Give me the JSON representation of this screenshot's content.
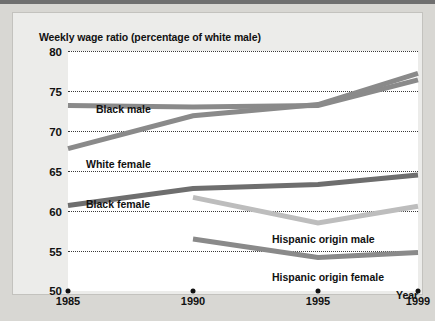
{
  "figure": {
    "title": "Weekly wage ratio (percentage of white male)",
    "year_axis_title": "Year"
  },
  "chart_data": {
    "type": "line",
    "title": "Weekly wage ratio (percentage of white male)",
    "xlabel": "Year",
    "ylabel": "Weekly wage ratio (percentage of white male)",
    "x": [
      1985,
      1990,
      1995,
      1999
    ],
    "xtick_labels": [
      "1985",
      "1990",
      "1995",
      "1999"
    ],
    "ytick_labels": [
      "80",
      "75",
      "70",
      "65",
      "60",
      "55",
      "50"
    ],
    "yticks": [
      80,
      75,
      70,
      65,
      60,
      55,
      50
    ],
    "ylim": [
      50,
      80
    ],
    "xlim": [
      1985,
      1999
    ],
    "grid": "horizontal-dotted",
    "legend": "inline-labels",
    "series": [
      {
        "name": "Black male",
        "color": "#8a8a8a",
        "x": [
          1985,
          1990,
          1995,
          1999
        ],
        "values": [
          73.2,
          73.0,
          73.2,
          76.4
        ]
      },
      {
        "name": "White female",
        "color": "#8a8a8a",
        "x": [
          1985,
          1990,
          1995,
          1999
        ],
        "values": [
          67.8,
          71.9,
          73.3,
          77.2
        ]
      },
      {
        "name": "Black female",
        "color": "#6e6e6e",
        "x": [
          1985,
          1990,
          1995,
          1999
        ],
        "values": [
          60.7,
          62.8,
          63.3,
          64.5
        ]
      },
      {
        "name": "Hispanic origin male",
        "color": "#bdbdbd",
        "x": [
          1990,
          1995,
          1999
        ],
        "values": [
          61.7,
          58.5,
          60.6
        ]
      },
      {
        "name": "Hispanic origin female",
        "color": "#8a8a8a",
        "x": [
          1990,
          1995,
          1999
        ],
        "values": [
          56.5,
          54.2,
          54.8
        ]
      }
    ],
    "series_labels": [
      {
        "text": "Black male",
        "left": 28,
        "top": 52
      },
      {
        "text": "White female",
        "left": 18,
        "top": 107
      },
      {
        "text": "Black female",
        "left": 18,
        "top": 147
      },
      {
        "text": "Hispanic origin male",
        "left": 204,
        "top": 182
      },
      {
        "text": "Hispanic origin female",
        "left": 204,
        "top": 220
      }
    ]
  }
}
